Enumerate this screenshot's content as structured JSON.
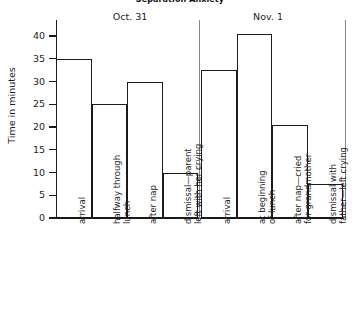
{
  "chart_data": {
    "type": "bar",
    "title": "Separation Anxiety",
    "xlabel": "",
    "ylabel": "Time in minutes",
    "ylim": [
      0,
      40
    ],
    "ytick_step": 5,
    "yticks": [
      0,
      5,
      10,
      15,
      20,
      25,
      30,
      35,
      40
    ],
    "grid": false,
    "legend": "none",
    "bar_style": "outlined-adjacent",
    "categories": [
      "arrival",
      "halfway through lunch",
      "after nap",
      "dismissal—parent left with her crying",
      "arrival",
      "at beginning of lunch",
      "after nap—cried for grandmother",
      "dismissal with father—left crying"
    ],
    "values": [
      35,
      25,
      30,
      10,
      32.5,
      40.5,
      20.5,
      7.5
    ],
    "groups": [
      {
        "label": "Oct. 31",
        "categories_start": 0,
        "categories_end": 3
      },
      {
        "label": "Nov. 1",
        "categories_start": 4,
        "categories_end": 7
      }
    ]
  },
  "axis": {
    "y_title": "Time in minutes",
    "tick_labels": [
      "40",
      "35",
      "30",
      "25",
      "20",
      "15",
      "10",
      "5",
      "0"
    ]
  },
  "x_labels": [
    {
      "line1": "arrival",
      "line2": ""
    },
    {
      "line1": "halfway through",
      "line2": "lunch"
    },
    {
      "line1": "after nap",
      "line2": ""
    },
    {
      "line1": "dismissal—parent",
      "line2": "left with her crying"
    },
    {
      "line1": "arrival",
      "line2": ""
    },
    {
      "line1": "at beginning",
      "line2": "of lunch"
    },
    {
      "line1": "after nap—cried",
      "line2": "for grandmother"
    },
    {
      "line1": "dismissal with",
      "line2": "father—left crying"
    }
  ],
  "groups": [
    {
      "label": "Oct. 31"
    },
    {
      "label": "Nov. 1"
    }
  ],
  "colors": {
    "bar_stroke": "#1a1a1a",
    "bar_fill": "#ffffff",
    "axis": "#1a1a1a",
    "divider": "#8a8a8a",
    "text": "#1d1d1d",
    "background": "#ffffff"
  }
}
